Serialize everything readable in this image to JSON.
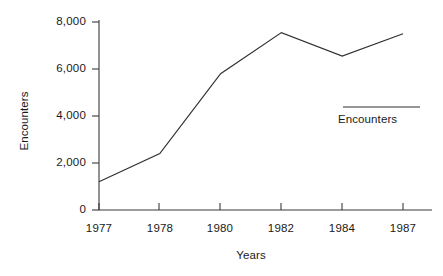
{
  "chart_data": {
    "type": "line",
    "title": "",
    "xlabel": "Years",
    "ylabel": "Encounters",
    "categories": [
      "1977",
      "1978",
      "1980",
      "1982",
      "1984",
      "1987"
    ],
    "series": [
      {
        "name": "Encounters",
        "values": [
          1200,
          2400,
          5800,
          7550,
          6550,
          7500
        ]
      }
    ],
    "ylim": [
      0,
      8000
    ],
    "yticks": [
      0,
      2000,
      4000,
      6000,
      8000
    ],
    "ytick_labels": [
      "0",
      "2,000",
      "4,000",
      "6,000",
      "8,000"
    ],
    "grid": false,
    "legend": {
      "position": "inside-right",
      "entries": [
        "Encounters"
      ]
    },
    "line_color": "#33312f"
  },
  "legend": {
    "entry_label": "Encounters"
  },
  "axes": {
    "x_title": "Years",
    "y_title": "Encounters"
  }
}
